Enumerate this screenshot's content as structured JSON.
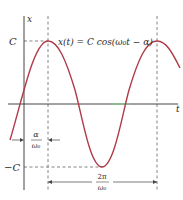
{
  "diagram": {
    "equation": "x(t) = C cos(ω₀t − α)",
    "axis_labels": {
      "y": "x",
      "x": "t"
    },
    "level_labels": {
      "pos": "C",
      "neg": "−C"
    },
    "phase_label": {
      "num": "α",
      "den": "ω₀"
    },
    "period_label": {
      "num": "2π",
      "den": "ω₀"
    },
    "colors": {
      "curve": "#b03a48",
      "axis": "#333333",
      "dashed": "#555555"
    }
  }
}
